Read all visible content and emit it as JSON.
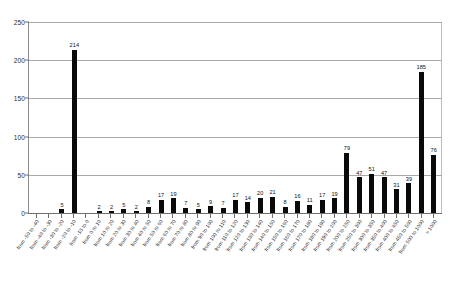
{
  "chart_data": {
    "type": "bar",
    "title": "",
    "subtitle": "",
    "xlabel": "",
    "ylabel": "",
    "ylim": [
      0,
      250
    ],
    "yticks": [
      0,
      50,
      100,
      150,
      200,
      250
    ],
    "grid": true,
    "legend": null,
    "legend_position": "none",
    "bar_color": "#0a0a0a",
    "axis_color": "#6f6f6f",
    "grid_color": "#a9a9a9",
    "show_value_labels": true,
    "label_rotation": -55,
    "categories": [
      "from -50 to -40",
      "from -40 to -30",
      "from -30 to -20",
      "from -20 to -10",
      "from -10 to 0",
      "from 0 to 10",
      "from 10 to 20",
      "from 20 to 30",
      "from 30 to 40",
      "from 40 to 50",
      "from 50 to 60",
      "from 60 to 70",
      "from 70 to 80",
      "from 80 to 90",
      "from 90 to 100",
      "from 100 to 110",
      "from 110 to 120",
      "from 120 to 130",
      "from 130 to 140",
      "from 140 to 150",
      "from 150 to 160",
      "from 160 to 170",
      "from 170 to 180",
      "from 180 to 190",
      "from 190 to 200",
      "from 200 to 250",
      "from 250 to 300",
      "from 300 to 350",
      "from 350 to 400",
      "from 400 to 450",
      "from 450 to 500",
      "from 500 to 1000",
      "> 1000"
    ],
    "values": [
      0,
      0,
      5,
      214,
      0,
      2,
      2,
      5,
      2,
      8,
      17,
      19,
      7,
      5,
      9,
      7,
      17,
      14,
      20,
      21,
      8,
      16,
      11,
      17,
      19,
      79,
      47,
      51,
      47,
      31,
      39,
      185,
      76
    ],
    "value_labels": [
      "",
      "",
      "5",
      "214",
      "",
      "2",
      "2",
      "5",
      "2",
      "8",
      "17",
      "19",
      "7",
      "5",
      "9",
      "7",
      "17",
      "14",
      "20",
      "21",
      "8",
      "16",
      "11",
      "17",
      "19",
      "79",
      "47",
      "51",
      "47",
      "31",
      "39",
      "185",
      "76"
    ]
  }
}
